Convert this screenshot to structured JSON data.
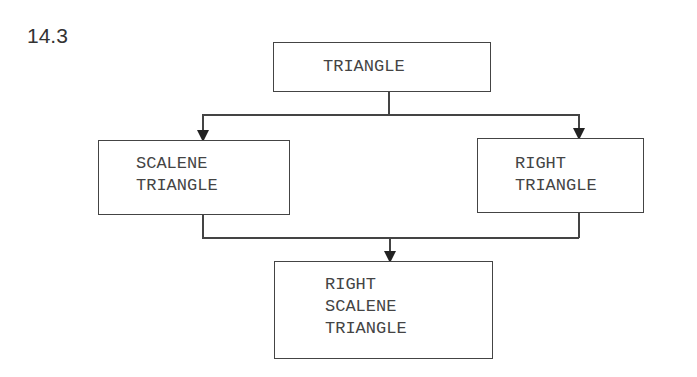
{
  "figure_label": "14.3",
  "nodes": {
    "root": {
      "lines": [
        "TRIANGLE"
      ]
    },
    "left": {
      "lines": [
        "SCALENE",
        "TRIANGLE"
      ]
    },
    "right": {
      "lines": [
        "RIGHT",
        "TRIANGLE"
      ]
    },
    "bottom": {
      "lines": [
        "RIGHT",
        "SCALENE",
        "TRIANGLE"
      ]
    }
  },
  "edges": [
    {
      "from": "TRIANGLE",
      "to": "SCALENE TRIANGLE"
    },
    {
      "from": "TRIANGLE",
      "to": "RIGHT TRIANGLE"
    },
    {
      "from": "SCALENE TRIANGLE",
      "to": "RIGHT SCALENE TRIANGLE"
    },
    {
      "from": "RIGHT TRIANGLE",
      "to": "RIGHT SCALENE TRIANGLE"
    }
  ]
}
